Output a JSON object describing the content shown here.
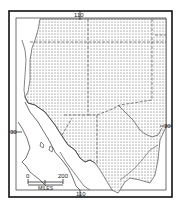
{
  "map": {
    "labels": {
      "meridian_top": "110",
      "meridian_bottom": "110",
      "parallel_left": "30",
      "parallel_right": "30"
    },
    "scale": {
      "start": "0",
      "end": "200",
      "unit": "MILES"
    },
    "colors": {
      "frame": "#111111",
      "land_lines": "#333333",
      "stipple": "#555555",
      "background": "#ffffff"
    }
  }
}
